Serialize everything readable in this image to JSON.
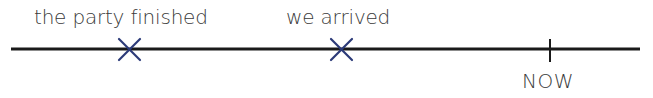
{
  "timeline": {
    "events": [
      {
        "label": "the party finished",
        "marker": "cross",
        "x": 128
      },
      {
        "label": "we arrived",
        "marker": "cross",
        "x": 341
      }
    ],
    "now": {
      "label": "NOW",
      "marker": "tick",
      "x": 550
    }
  },
  "colors": {
    "line": "#1a1a1a",
    "cross": "#2b3a78",
    "text": "#3a3a3a"
  }
}
